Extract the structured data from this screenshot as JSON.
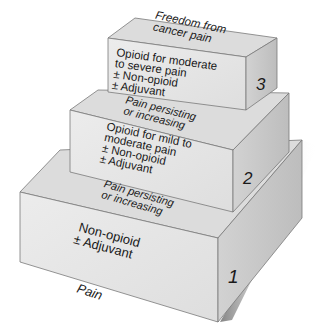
{
  "diagram": {
    "type": "3d-step-ladder",
    "colors": {
      "front_face": "#e6e6e6",
      "top_face": "#dadada",
      "side_face": "#c8c8c8",
      "edge": "#7a7a7a",
      "text": "#1a1a1a",
      "shadow": "#9a9a9a"
    },
    "steps": [
      {
        "number": "1",
        "front_lines": [
          "Non-opioid",
          "± Adjuvant"
        ],
        "top_lines": [
          "Pain persisting",
          "or increasing"
        ]
      },
      {
        "number": "2",
        "front_lines": [
          "Opioid for mild to",
          "moderate pain",
          "± Non-opioid",
          "± Adjuvant"
        ],
        "top_lines": [
          "Pain persisting",
          "or increasing"
        ]
      },
      {
        "number": "3",
        "front_lines": [
          "Opioid for moderate",
          "to severe pain",
          "± Non-opioid",
          "± Adjuvant"
        ],
        "top_lines": [
          "Freedom from",
          "cancer pain"
        ]
      }
    ],
    "base_label": "Pain"
  }
}
